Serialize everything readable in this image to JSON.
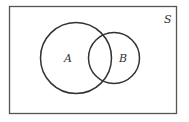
{
  "diagram": {
    "type": "venn",
    "universe": {
      "label": "S",
      "x": 9,
      "y": 6,
      "width": 168,
      "height": 108
    },
    "sets": [
      {
        "label": "A",
        "cx": 76,
        "cy": 58,
        "r": 36
      },
      {
        "label": "B",
        "cx": 114,
        "cy": 58,
        "r": 26
      }
    ],
    "stroke_color": "#333333",
    "background": "#ffffff"
  }
}
